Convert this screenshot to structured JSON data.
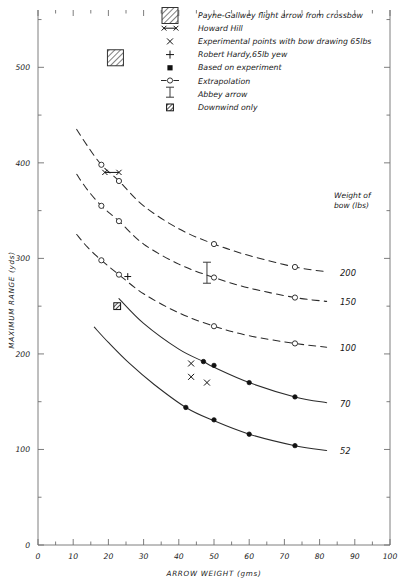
{
  "chart_data": {
    "type": "line",
    "title": "",
    "xlabel": "ARROW WEIGHT (gms)",
    "ylabel": "MAXIMUM RANGE (yds)",
    "xlim": [
      0,
      100
    ],
    "ylim": [
      0,
      560
    ],
    "x_ticks": [
      0,
      10,
      20,
      30,
      40,
      50,
      60,
      70,
      80,
      90,
      100
    ],
    "x_tick_labels": [
      "0",
      "10",
      "20",
      "30",
      "40",
      "50",
      "60",
      "70",
      "80",
      "90",
      "100"
    ],
    "x_minor_step": 5,
    "y_ticks": [
      0,
      100,
      200,
      300,
      400,
      500
    ],
    "y_tick_labels": [
      "0",
      "100",
      "200",
      "300",
      "400",
      "500"
    ],
    "y_minor_step": 50,
    "grid": false,
    "legend_position": "top-right",
    "series": [
      {
        "name": "200",
        "style": "dashed",
        "label": "200",
        "points": [
          [
            11,
            435
          ],
          [
            14,
            418
          ],
          [
            18,
            398
          ],
          [
            23,
            381
          ],
          [
            30,
            355
          ],
          [
            40,
            331
          ],
          [
            50,
            315
          ],
          [
            60,
            303
          ],
          [
            73,
            291
          ],
          [
            82,
            286
          ]
        ],
        "markers": [
          {
            "x": 18,
            "y": 398,
            "type": "open-circle"
          },
          {
            "x": 23,
            "y": 381,
            "type": "open-circle"
          },
          {
            "x": 50,
            "y": 315,
            "type": "open-circle"
          },
          {
            "x": 73,
            "y": 291,
            "type": "open-circle"
          }
        ]
      },
      {
        "name": "150",
        "style": "dashed",
        "label": "150",
        "points": [
          [
            11,
            388
          ],
          [
            14,
            372
          ],
          [
            18,
            355
          ],
          [
            23,
            339
          ],
          [
            30,
            315
          ],
          [
            40,
            294
          ],
          [
            50,
            280
          ],
          [
            60,
            269
          ],
          [
            73,
            259
          ],
          [
            82,
            255
          ]
        ],
        "markers": [
          {
            "x": 18,
            "y": 355,
            "type": "open-circle"
          },
          {
            "x": 23,
            "y": 339,
            "type": "open-circle"
          },
          {
            "x": 50,
            "y": 280,
            "type": "open-circle"
          },
          {
            "x": 73,
            "y": 259,
            "type": "open-circle"
          }
        ]
      },
      {
        "name": "100",
        "style": "dashed",
        "label": "100",
        "points": [
          [
            11,
            325
          ],
          [
            14,
            312
          ],
          [
            18,
            298
          ],
          [
            23,
            283
          ],
          [
            30,
            263
          ],
          [
            40,
            243
          ],
          [
            50,
            229
          ],
          [
            60,
            219
          ],
          [
            73,
            211
          ],
          [
            82,
            207
          ]
        ],
        "markers": [
          {
            "x": 18,
            "y": 298,
            "type": "open-circle"
          },
          {
            "x": 23,
            "y": 283,
            "type": "open-circle"
          },
          {
            "x": 50,
            "y": 229,
            "type": "open-circle"
          },
          {
            "x": 73,
            "y": 211,
            "type": "open-circle"
          }
        ]
      },
      {
        "name": "70",
        "style": "solid",
        "label": "70",
        "points": [
          [
            23,
            258
          ],
          [
            30,
            232
          ],
          [
            40,
            205
          ],
          [
            47,
            192
          ],
          [
            50,
            186
          ],
          [
            60,
            170
          ],
          [
            73,
            155
          ],
          [
            82,
            149
          ]
        ],
        "markers": [
          {
            "x": 47,
            "y": 192,
            "type": "filled-circle"
          },
          {
            "x": 50,
            "y": 188,
            "type": "filled-circle"
          },
          {
            "x": 60,
            "y": 170,
            "type": "filled-circle"
          },
          {
            "x": 73,
            "y": 155,
            "type": "filled-circle"
          }
        ]
      },
      {
        "name": "52",
        "style": "solid",
        "label": "52",
        "points": [
          [
            16,
            228
          ],
          [
            20,
            212
          ],
          [
            26,
            190
          ],
          [
            33,
            168
          ],
          [
            42,
            144
          ],
          [
            50,
            130
          ],
          [
            60,
            116
          ],
          [
            73,
            104
          ],
          [
            82,
            99
          ]
        ],
        "markers": [
          {
            "x": 42,
            "y": 144,
            "type": "filled-circle"
          },
          {
            "x": 50,
            "y": 131,
            "type": "filled-circle"
          },
          {
            "x": 60,
            "y": 116,
            "type": "filled-circle"
          },
          {
            "x": 73,
            "y": 104,
            "type": "filled-circle"
          }
        ]
      }
    ],
    "annotations": [
      {
        "name": "payne-gallwey-point",
        "type": "hatched-square",
        "x": 22,
        "y": 510
      },
      {
        "name": "howard-hill-point",
        "type": "x-line-x",
        "x1": 19,
        "x2": 23,
        "y": 390
      },
      {
        "name": "robert-hardy-point",
        "type": "plus",
        "x": 25.5,
        "y": 281
      },
      {
        "name": "downwind-only-point",
        "type": "crossed-square",
        "x": 22.5,
        "y": 250
      },
      {
        "name": "abbey-arrow-point",
        "type": "ibar",
        "x": 48,
        "y": 285,
        "err": 11
      },
      {
        "name": "experimental-point-1",
        "type": "x",
        "x": 43.5,
        "y": 190
      },
      {
        "name": "experimental-point-2",
        "type": "x",
        "x": 43.5,
        "y": 176
      },
      {
        "name": "experimental-point-3",
        "type": "x",
        "x": 48,
        "y": 170
      }
    ],
    "curve_label_header": [
      "Weight of",
      "bow (lbs)"
    ]
  },
  "legend": {
    "items": [
      {
        "marker": "hatched-square",
        "label": "Payne-Gallwey flight arrow from crossbow"
      },
      {
        "marker": "x-line-x",
        "label": "Howard Hill"
      },
      {
        "marker": "x",
        "label": "Experimental points with bow drawing 65lbs"
      },
      {
        "marker": "plus",
        "label": "Robert Hardy,65lb yew"
      },
      {
        "marker": "filled-square",
        "label": "Based on experiment"
      },
      {
        "marker": "dash-circle-dash",
        "label": "Extrapolation"
      },
      {
        "marker": "ibar",
        "label": "Abbey arrow"
      },
      {
        "marker": "crossed-square",
        "label": "Downwind only"
      }
    ]
  },
  "colors": {
    "background": "#ffffff",
    "ink": "#1a1a1a",
    "axis": "#6f6f6f",
    "curve": "#2b2b2b"
  }
}
